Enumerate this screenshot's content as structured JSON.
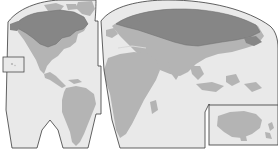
{
  "figure": {
    "type": "world-map",
    "projection_name": "interrupted-goode-homolosine",
    "title": "",
    "background_color": "#ffffff"
  },
  "palette": {
    "ocean": "#e9e9e9",
    "land": "#b4b4b4",
    "highlight_land": "#868686",
    "outline": "#3a3a3a",
    "inset_border": "#4a4a4a",
    "interruption_fill": "#ffffff"
  },
  "legend": {
    "visible": false,
    "entries": [
      {
        "label": "Highlighted range",
        "color": "#868686"
      },
      {
        "label": "Other land",
        "color": "#b4b4b4"
      },
      {
        "label": "Ocean",
        "color": "#e9e9e9"
      }
    ]
  },
  "lobes": [
    {
      "name": "americas-lobe",
      "region": "North and South America"
    },
    {
      "name": "eurasia-africa-lobe",
      "region": "Europe, Africa and Asia"
    }
  ],
  "highlighted_regions": [
    {
      "name": "canada-alaska-highlight",
      "region": "Canada and Alaska"
    },
    {
      "name": "russia-siberia-highlight",
      "region": "Russia and northern Eurasia"
    }
  ],
  "insets": [
    {
      "name": "left-inset",
      "label": "",
      "region": "Pacific islands"
    },
    {
      "name": "australia-inset",
      "label": "",
      "region": "Australia and New Zealand"
    }
  ],
  "annotations": []
}
